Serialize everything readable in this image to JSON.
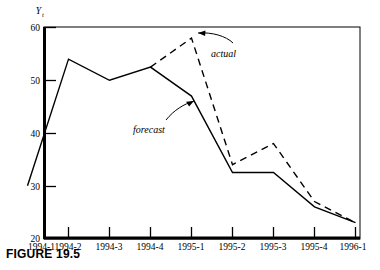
{
  "figure": {
    "caption": "FIGURE 19.5",
    "y_axis_title": "Y",
    "y_axis_title_sub": "t"
  },
  "annotations": [
    {
      "name": "actual",
      "label": "actual"
    },
    {
      "name": "forecast",
      "label": "forecast"
    }
  ],
  "chart_data": {
    "type": "line",
    "title": "FIGURE 19.5",
    "xlabel": "",
    "ylabel": "Yt",
    "ylim": [
      20,
      60
    ],
    "yticks": [
      20,
      30,
      40,
      50,
      60
    ],
    "ytick_labels": [
      "20",
      "30",
      "40",
      "50",
      "60"
    ],
    "grid": false,
    "legend": "annotated-inline",
    "categories": [
      "1994-1",
      "1994-2",
      "1994-3",
      "1994-4",
      "1995-1",
      "1995-2",
      "1995-3",
      "1995-4",
      "1996-1"
    ],
    "series": [
      {
        "name": "forecast",
        "style": "solid",
        "color": "#000000",
        "x": [
          "1994-1",
          "1994-2",
          "1994-3",
          "1994-4",
          "1995-1",
          "1995-2",
          "1995-3",
          "1995-4",
          "1996-1"
        ],
        "values": [
          30,
          54,
          50,
          52.5,
          47,
          32.5,
          32.5,
          26,
          23
        ]
      },
      {
        "name": "actual",
        "style": "dashed",
        "color": "#000000",
        "x": [
          "1994-4",
          "1995-1",
          "1995-2",
          "1995-3",
          "1995-4",
          "1996-1"
        ],
        "values": [
          52.5,
          58,
          34,
          38,
          27,
          23
        ]
      }
    ]
  }
}
